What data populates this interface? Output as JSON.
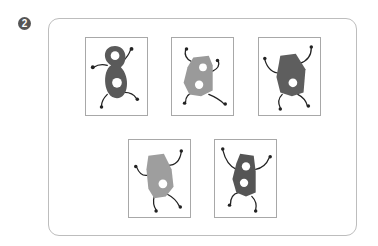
{
  "question": {
    "number_label": "2"
  },
  "cards": [
    {
      "id": "card-1",
      "shape": "figure-eight",
      "fill": "#5a5a5a",
      "holes": 2
    },
    {
      "id": "card-2",
      "shape": "hexagon-tall",
      "fill": "#9a9a9a",
      "holes": 2
    },
    {
      "id": "card-3",
      "shape": "hexagon-wide",
      "fill": "#5e5e5e",
      "holes": 1
    },
    {
      "id": "card-4",
      "shape": "hexagon-tall",
      "fill": "#9e9e9e",
      "holes": 1
    },
    {
      "id": "card-5",
      "shape": "hexagon-tall",
      "fill": "#555555",
      "holes": 2
    }
  ]
}
